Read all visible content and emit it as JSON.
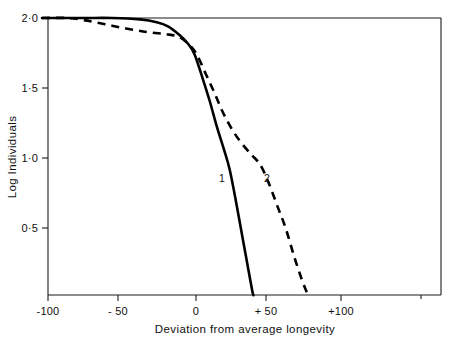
{
  "chart_data": {
    "type": "line",
    "title": "",
    "xlabel": "Deviation from average longevity",
    "ylabel": "Log  Individuals",
    "xlim": [
      -110,
      175
    ],
    "ylim": [
      0.02,
      2.0
    ],
    "xticks": [
      -100,
      -50,
      0,
      50,
      100
    ],
    "xticklabels": [
      "-100",
      "- 50",
      "0",
      "+ 50",
      "+100"
    ],
    "yticks": [
      0.5,
      1.0,
      1.5,
      2.0
    ],
    "yticklabels": [
      "0·5",
      "1·0",
      "1·5",
      "2·0"
    ],
    "grid": false,
    "legend_position": "inline-annotations",
    "annotations": [
      {
        "text": "1",
        "x": 19,
        "y": 0.88,
        "series": "1"
      },
      {
        "text": "2",
        "x": 50,
        "y": 0.88,
        "series": "2"
      }
    ],
    "series": [
      {
        "name": "1",
        "label": "1",
        "style": "solid",
        "points": [
          {
            "x": -110,
            "y": 2.0
          },
          {
            "x": -80,
            "y": 2.0
          },
          {
            "x": -60,
            "y": 2.0
          },
          {
            "x": -40,
            "y": 1.99
          },
          {
            "x": -28,
            "y": 1.97
          },
          {
            "x": -20,
            "y": 1.94
          },
          {
            "x": -12,
            "y": 1.88
          },
          {
            "x": -6,
            "y": 1.82
          },
          {
            "x": -1,
            "y": 1.74
          },
          {
            "x": 5,
            "y": 1.56
          },
          {
            "x": 10,
            "y": 1.4
          },
          {
            "x": 15,
            "y": 1.22
          },
          {
            "x": 20,
            "y": 1.06
          },
          {
            "x": 24,
            "y": 0.92
          },
          {
            "x": 28,
            "y": 0.72
          },
          {
            "x": 32,
            "y": 0.5
          },
          {
            "x": 36,
            "y": 0.28
          },
          {
            "x": 40,
            "y": 0.06
          },
          {
            "x": 41,
            "y": 0.02
          }
        ]
      },
      {
        "name": "2",
        "label": "2",
        "style": "dashed",
        "points": [
          {
            "x": -110,
            "y": 2.0
          },
          {
            "x": -92,
            "y": 2.0
          },
          {
            "x": -80,
            "y": 1.985
          },
          {
            "x": -65,
            "y": 1.955
          },
          {
            "x": -50,
            "y": 1.925
          },
          {
            "x": -35,
            "y": 1.9
          },
          {
            "x": -22,
            "y": 1.885
          },
          {
            "x": -12,
            "y": 1.865
          },
          {
            "x": -4,
            "y": 1.8
          },
          {
            "x": 1,
            "y": 1.73
          },
          {
            "x": 7,
            "y": 1.6
          },
          {
            "x": 13,
            "y": 1.47
          },
          {
            "x": 19,
            "y": 1.33
          },
          {
            "x": 26,
            "y": 1.2
          },
          {
            "x": 33,
            "y": 1.1
          },
          {
            "x": 40,
            "y": 1.02
          },
          {
            "x": 46,
            "y": 0.95
          },
          {
            "x": 52,
            "y": 0.82
          },
          {
            "x": 58,
            "y": 0.66
          },
          {
            "x": 64,
            "y": 0.5
          },
          {
            "x": 70,
            "y": 0.3
          },
          {
            "x": 76,
            "y": 0.12
          },
          {
            "x": 80,
            "y": 0.02
          }
        ]
      }
    ]
  },
  "axis": {
    "xlabel": "Deviation from average longevity",
    "ylabel": "Log  Individuals",
    "xticklabels": [
      "-100",
      "- 50",
      "0",
      "+ 50",
      "+100"
    ],
    "yticklabels": [
      "0·5",
      "1·0",
      "1·5",
      "2·0"
    ]
  },
  "labels": {
    "curve_one": "1",
    "curve_two": "2"
  }
}
